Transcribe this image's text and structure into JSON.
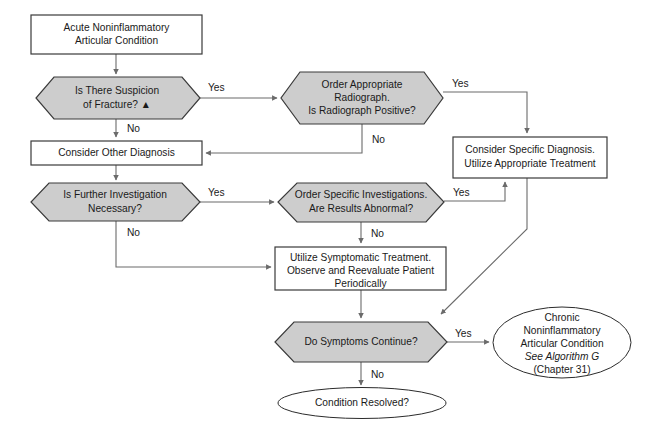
{
  "diagram": {
    "colors": {
      "decision_fill": "#cdcdcd",
      "process_fill": "#ffffff",
      "stroke": "#3a3a3a",
      "connector": "#6b6b6b",
      "text": "#1a1a1a",
      "background": "#ffffff"
    },
    "nodes": {
      "start": {
        "shape": "rectangle",
        "lines": [
          "Acute Noninflammatory",
          "Articular Condition"
        ]
      },
      "suspicion_fracture": {
        "shape": "hexagon",
        "lines": [
          "Is There Suspicion",
          "of Fracture?  ▲"
        ]
      },
      "order_radiograph": {
        "shape": "hexagon",
        "lines": [
          "Order Appropriate",
          "Radiograph.",
          "Is Radiograph Positive?"
        ]
      },
      "consider_other_diagnosis": {
        "shape": "rectangle",
        "lines": [
          "Consider Other Diagnosis"
        ]
      },
      "consider_specific_diagnosis": {
        "shape": "rectangle",
        "lines": [
          "Consider Specific Diagnosis.",
          "Utilize Appropriate Treatment"
        ]
      },
      "further_investigation": {
        "shape": "hexagon",
        "lines": [
          "Is Further Investigation",
          "Necessary?"
        ]
      },
      "order_specific_investigations": {
        "shape": "hexagon",
        "lines": [
          "Order Specific Investigations.",
          "Are Results Abnormal?"
        ]
      },
      "symptomatic_treatment": {
        "shape": "rectangle",
        "lines": [
          "Utilize Symptomatic Treatment.",
          "Observe and Reevaluate Patient",
          "Periodically"
        ]
      },
      "symptoms_continue": {
        "shape": "hexagon",
        "lines": [
          "Do Symptoms Continue?"
        ]
      },
      "chronic_condition": {
        "shape": "ellipse",
        "lines": [
          "Chronic",
          "Noninflammatory",
          "Articular Condition",
          "See Algorithm G",
          "(Chapter 31)"
        ],
        "italic_line_index": 3
      },
      "condition_resolved": {
        "shape": "ellipse",
        "lines": [
          "Condition Resolved?"
        ]
      }
    },
    "edge_labels": {
      "fracture_yes": "Yes",
      "fracture_no": "No",
      "radiograph_yes": "Yes",
      "radiograph_no": "No",
      "investigation_yes": "Yes",
      "investigation_no": "No",
      "results_yes": "Yes",
      "results_no": "No",
      "symptoms_yes": "Yes",
      "symptoms_no": "No"
    }
  }
}
